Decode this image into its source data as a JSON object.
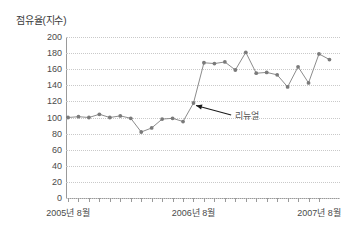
{
  "chart_data": {
    "type": "line",
    "title": "점유율(지수)",
    "xlabel": "",
    "ylabel": "",
    "ylim": [
      0,
      200
    ],
    "ytick_step": 20,
    "yticks": [
      "200",
      "180",
      "160",
      "140",
      "120",
      "100",
      "80",
      "60",
      "40",
      "20",
      "0"
    ],
    "grid": true,
    "legend": "none",
    "x_tick_labels": [
      "2005년 8월",
      "2006년 8월",
      "2007년 8월"
    ],
    "x_tick_positions": [
      0,
      12,
      24
    ],
    "categories": [
      "2005-08",
      "2005-09",
      "2005-10",
      "2005-11",
      "2005-12",
      "2006-01",
      "2006-02",
      "2006-03",
      "2006-04",
      "2006-05",
      "2006-06",
      "2006-07",
      "2006-08",
      "2006-09",
      "2006-10",
      "2006-11",
      "2006-12",
      "2007-01",
      "2007-02",
      "2007-03",
      "2007-04",
      "2007-05",
      "2007-06",
      "2007-07",
      "2007-08"
    ],
    "values": [
      100,
      101,
      100,
      104,
      100,
      102,
      99,
      82,
      87,
      98,
      99,
      95,
      118,
      168,
      167,
      169,
      159,
      181,
      155,
      156,
      153,
      138,
      163,
      143,
      179
    ],
    "series_color": "#8c8c8c",
    "marker_color": "#7a7a7a",
    "grid_color": "#c9c9c9",
    "axis_color": "#9a9a9a",
    "annotations": [
      {
        "text": "리뉴얼",
        "target_index": 12,
        "target_value": 118,
        "label_x_index": 15.6,
        "label_y_value": 103
      }
    ],
    "last_point_note": "series ends at 2007-08 with a trailing descent to 172",
    "trailing_value": 172
  },
  "annotation": {
    "renewal_label": "리뉴얼"
  }
}
